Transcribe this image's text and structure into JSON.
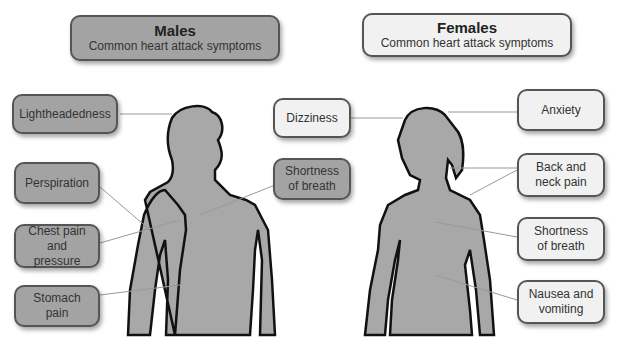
{
  "males": {
    "title": "Males",
    "subtitle": "Common heart attack symptoms",
    "symptoms": [
      "Lightheadedness",
      "Perspiration",
      "Chest pain and pressure",
      "Stomach pain",
      "Shortness of breath"
    ]
  },
  "females": {
    "title": "Females",
    "subtitle": "Common heart attack symptoms",
    "symptoms": [
      "Dizziness",
      "Anxiety",
      "Back and neck pain",
      "Shortness of breath",
      "Nausea and vomiting"
    ]
  },
  "colors": {
    "male_box": "#a3a3a3",
    "female_box": "#f1f1f1",
    "body": "#a8a8a8",
    "outline": "#111111"
  }
}
